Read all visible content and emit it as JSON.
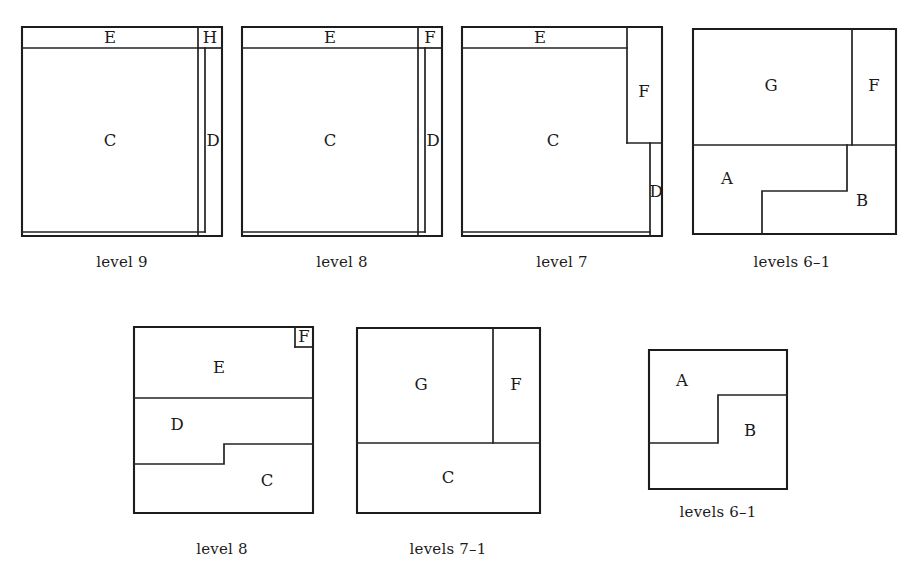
{
  "figure": {
    "kind": "rectangle-partition-diagram-series",
    "background_color": "#ffffff",
    "line_color": "#1c1c1c",
    "text_color": "#1a1a1a",
    "width": 917,
    "height": 572
  },
  "diagrams": [
    {
      "id": "diagram-1",
      "caption": "level 9",
      "caption_x": 122,
      "caption_y": 253,
      "frame": {
        "x": 22,
        "y": 27,
        "w": 200,
        "h": 209
      },
      "edges": [
        {
          "name": "outer-frame",
          "d": "M 22 27 L 222 27 L 222 236 L 22 236 Z"
        },
        {
          "name": "e-bottom-divider",
          "d": "M 22 48 L 198 48"
        },
        {
          "name": "eh-vertical-divider",
          "d": "M 198 27 L 198 236"
        },
        {
          "name": "h-bottom-divider",
          "d": "M 198 48 L 222 48"
        },
        {
          "name": "c-right-divider",
          "d": "M 205 48 L 205 232"
        },
        {
          "name": "c-bottom-divider",
          "d": "M 22 232 L 205 232"
        }
      ],
      "labels": [
        {
          "name": "cell-label-E",
          "text": "E",
          "x": 110,
          "y": 38
        },
        {
          "name": "cell-label-H",
          "text": "H",
          "x": 210,
          "y": 38
        },
        {
          "name": "cell-label-C",
          "text": "C",
          "x": 110,
          "y": 141
        },
        {
          "name": "cell-label-D",
          "text": "D",
          "x": 213,
          "y": 141
        }
      ]
    },
    {
      "id": "diagram-2",
      "caption": "level 8",
      "caption_x": 342,
      "caption_y": 253,
      "frame": {
        "x": 242,
        "y": 27,
        "w": 200,
        "h": 209
      },
      "edges": [
        {
          "name": "outer-frame",
          "d": "M 242 27 L 442 27 L 442 236 L 242 236 Z"
        },
        {
          "name": "e-bottom-divider",
          "d": "M 242 48 L 418 48"
        },
        {
          "name": "ef-vertical-divider",
          "d": "M 418 27 L 418 236"
        },
        {
          "name": "f-bottom-divider",
          "d": "M 418 48 L 442 48"
        },
        {
          "name": "c-right-divider",
          "d": "M 425 48 L 425 232"
        },
        {
          "name": "c-bottom-divider",
          "d": "M 242 232 L 425 232"
        }
      ],
      "labels": [
        {
          "name": "cell-label-E",
          "text": "E",
          "x": 330,
          "y": 38
        },
        {
          "name": "cell-label-F",
          "text": "F",
          "x": 430,
          "y": 38
        },
        {
          "name": "cell-label-C",
          "text": "C",
          "x": 330,
          "y": 141
        },
        {
          "name": "cell-label-D",
          "text": "D",
          "x": 433,
          "y": 141
        }
      ]
    },
    {
      "id": "diagram-3",
      "caption": "level 7",
      "caption_x": 562,
      "caption_y": 253,
      "frame": {
        "x": 462,
        "y": 27,
        "w": 200,
        "h": 209
      },
      "edges": [
        {
          "name": "outer-frame",
          "d": "M 462 27 L 662 27 L 662 236 L 462 236 Z"
        },
        {
          "name": "e-bottom-divider",
          "d": "M 462 48 L 627 48"
        },
        {
          "name": "ef-vertical-divider",
          "d": "M 627 27 L 627 143"
        },
        {
          "name": "f-bottom-divider",
          "d": "M 627 143 L 662 143"
        },
        {
          "name": "c-right-divider",
          "d": "M 650 143 L 650 236"
        },
        {
          "name": "c-bottom-divider",
          "d": "M 462 232 L 650 232"
        }
      ],
      "labels": [
        {
          "name": "cell-label-E",
          "text": "E",
          "x": 540,
          "y": 38
        },
        {
          "name": "cell-label-F",
          "text": "F",
          "x": 644,
          "y": 92
        },
        {
          "name": "cell-label-C",
          "text": "C",
          "x": 553,
          "y": 141
        },
        {
          "name": "cell-label-D",
          "text": "D",
          "x": 656,
          "y": 192
        }
      ]
    },
    {
      "id": "diagram-4",
      "caption": "levels 6–1",
      "caption_x": 792,
      "caption_y": 253,
      "frame": {
        "x": 693,
        "y": 29,
        "w": 203,
        "h": 205
      },
      "edges": [
        {
          "name": "outer-frame",
          "d": "M 693 29 L 896 29 L 896 234 L 693 234 Z"
        },
        {
          "name": "gf-vertical-divider",
          "d": "M 852 29 L 852 145"
        },
        {
          "name": "top-bottom-divider",
          "d": "M 693 145 L 896 145"
        },
        {
          "name": "ab-step-boundary",
          "d": "M 847 145 L 847 191 L 762 191 L 762 234"
        }
      ],
      "labels": [
        {
          "name": "cell-label-G",
          "text": "G",
          "x": 771,
          "y": 86
        },
        {
          "name": "cell-label-F",
          "text": "F",
          "x": 874,
          "y": 86
        },
        {
          "name": "cell-label-A",
          "text": "A",
          "x": 727,
          "y": 179
        },
        {
          "name": "cell-label-B",
          "text": "B",
          "x": 862,
          "y": 201
        }
      ]
    },
    {
      "id": "diagram-5",
      "caption": "level 8",
      "caption_x": 222,
      "caption_y": 540,
      "frame": {
        "x": 134,
        "y": 327,
        "w": 179,
        "h": 186
      },
      "edges": [
        {
          "name": "outer-frame",
          "d": "M 134 327 L 313 327 L 313 513 L 134 513 Z"
        },
        {
          "name": "f-left-divider",
          "d": "M 295 327 L 295 347"
        },
        {
          "name": "f-bottom-divider",
          "d": "M 295 347 L 313 347"
        },
        {
          "name": "e-bottom-divider",
          "d": "M 134 398 L 313 398"
        },
        {
          "name": "dc-step-boundary",
          "d": "M 313 444 L 224 444 L 224 464 L 134 464"
        }
      ],
      "labels": [
        {
          "name": "cell-label-F",
          "text": "F",
          "x": 304,
          "y": 337
        },
        {
          "name": "cell-label-E",
          "text": "E",
          "x": 219,
          "y": 368
        },
        {
          "name": "cell-label-D",
          "text": "D",
          "x": 177,
          "y": 425
        },
        {
          "name": "cell-label-C",
          "text": "C",
          "x": 267,
          "y": 481
        }
      ]
    },
    {
      "id": "diagram-6",
      "caption": "levels 7–1",
      "caption_x": 448,
      "caption_y": 540,
      "frame": {
        "x": 357,
        "y": 328,
        "w": 183,
        "h": 185
      },
      "edges": [
        {
          "name": "outer-frame",
          "d": "M 357 328 L 540 328 L 540 513 L 357 513 Z"
        },
        {
          "name": "gf-vertical-divider",
          "d": "M 493 328 L 493 443"
        },
        {
          "name": "top-bottom-divider",
          "d": "M 357 443 L 540 443"
        }
      ],
      "labels": [
        {
          "name": "cell-label-G",
          "text": "G",
          "x": 421,
          "y": 385
        },
        {
          "name": "cell-label-F",
          "text": "F",
          "x": 516,
          "y": 385
        },
        {
          "name": "cell-label-C",
          "text": "C",
          "x": 448,
          "y": 478
        }
      ]
    },
    {
      "id": "diagram-7",
      "caption": "levels 6–1",
      "caption_x": 718,
      "caption_y": 503,
      "frame": {
        "x": 649,
        "y": 350,
        "w": 138,
        "h": 139
      },
      "edges": [
        {
          "name": "outer-frame",
          "d": "M 649 350 L 787 350 L 787 489 L 649 489 Z"
        },
        {
          "name": "ab-step-boundary",
          "d": "M 787 395 L 718 395 L 718 443 L 649 443"
        }
      ],
      "labels": [
        {
          "name": "cell-label-A",
          "text": "A",
          "x": 682,
          "y": 381
        },
        {
          "name": "cell-label-B",
          "text": "B",
          "x": 750,
          "y": 431
        }
      ]
    }
  ]
}
